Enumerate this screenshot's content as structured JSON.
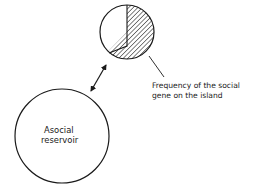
{
  "diagram": {
    "island": {
      "label_line1": "Frequency of the social",
      "label_line2": "gene on the island",
      "social_fraction": 0.62,
      "hatch_color": "#1a1a1a"
    },
    "reservoir": {
      "label_line1": "Asocial",
      "label_line2": "reservoir"
    },
    "connector": {
      "type": "double-arrow"
    }
  }
}
